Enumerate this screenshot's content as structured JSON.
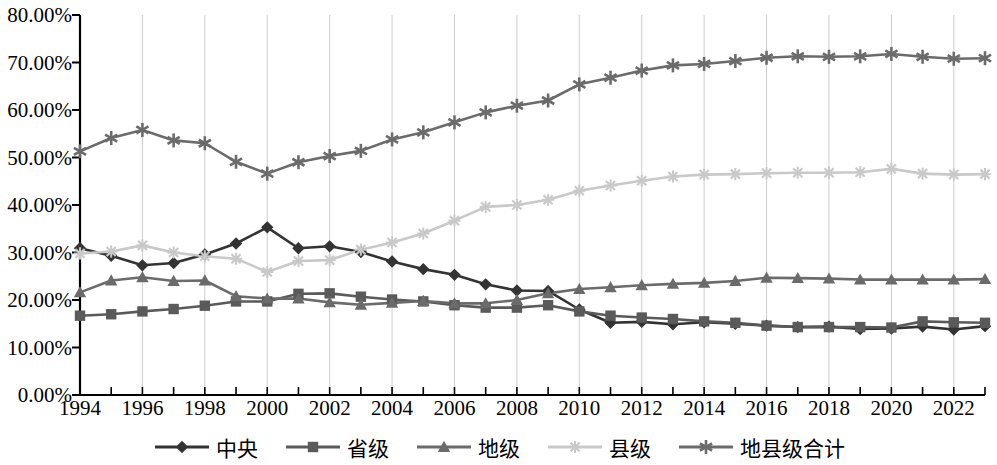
{
  "chart_data": {
    "type": "line",
    "title": "",
    "xlabel": "",
    "ylabel": "",
    "x": [
      1994,
      1995,
      1996,
      1997,
      1998,
      1999,
      2000,
      2001,
      2002,
      2003,
      2004,
      2005,
      2006,
      2007,
      2008,
      2009,
      2010,
      2011,
      2012,
      2013,
      2014,
      2015,
      2016,
      2017,
      2018,
      2019,
      2020,
      2021,
      2022,
      2023
    ],
    "tick_labels_x": [
      "1994",
      "1996",
      "1998",
      "2000",
      "2002",
      "2004",
      "2006",
      "2008",
      "2010",
      "2012",
      "2014",
      "2016",
      "2018",
      "2020",
      "2022"
    ],
    "tick_labels_y": [
      "0.00%",
      "10.00%",
      "20.00%",
      "30.00%",
      "40.00%",
      "50.00%",
      "60.00%",
      "70.00%",
      "80.00%"
    ],
    "ylim": [
      0,
      80
    ],
    "xlim": [
      1994,
      2023
    ],
    "grid": "vertical-every-2-years",
    "legend_position": "bottom",
    "series": [
      {
        "name": "中央",
        "marker": "diamond",
        "color": "#333333",
        "values": [
          30.9,
          29.3,
          27.3,
          27.8,
          29.6,
          31.9,
          35.3,
          30.9,
          31.3,
          30.1,
          28.1,
          26.5,
          25.3,
          23.3,
          22.0,
          21.9,
          18.0,
          15.2,
          15.4,
          14.9,
          15.3,
          15.0,
          14.6,
          14.3,
          14.4,
          13.9,
          14.0,
          14.4,
          13.8,
          14.5
        ]
      },
      {
        "name": "省级",
        "marker": "square",
        "color": "#5a5a5a",
        "values": [
          16.7,
          17.0,
          17.6,
          18.1,
          18.8,
          19.7,
          19.7,
          21.3,
          21.4,
          20.7,
          20.1,
          19.7,
          18.9,
          18.4,
          18.4,
          18.9,
          17.6,
          16.7,
          16.3,
          16.0,
          15.5,
          15.2,
          14.6,
          14.3,
          14.3,
          14.3,
          14.2,
          15.5,
          15.3,
          15.2
        ]
      },
      {
        "name": "地级",
        "marker": "triangle",
        "color": "#6b6b6b",
        "values": [
          21.6,
          24.1,
          24.8,
          24.0,
          24.1,
          20.8,
          20.3,
          20.3,
          19.5,
          19.0,
          19.4,
          19.8,
          19.3,
          19.3,
          20.0,
          21.4,
          22.3,
          22.7,
          23.1,
          23.4,
          23.6,
          24.0,
          24.7,
          24.6,
          24.5,
          24.3,
          24.3,
          24.3,
          24.3,
          24.4
        ]
      },
      {
        "name": "县级",
        "marker": "x-star",
        "color": "#c9c9c9",
        "values": [
          29.8,
          30.2,
          31.5,
          30.0,
          29.2,
          28.7,
          25.9,
          28.2,
          28.4,
          30.6,
          32.1,
          34.0,
          36.7,
          39.6,
          40.0,
          41.1,
          43.0,
          44.1,
          45.1,
          46.0,
          46.4,
          46.5,
          46.7,
          46.8,
          46.8,
          46.9,
          47.6,
          46.6,
          46.4,
          46.5
        ]
      },
      {
        "name": "地县级合计",
        "marker": "asterisk",
        "color": "#6b6b6b",
        "values": [
          51.3,
          54.1,
          55.8,
          53.6,
          53.0,
          49.1,
          46.6,
          49.0,
          50.3,
          51.4,
          53.8,
          55.3,
          57.4,
          59.5,
          60.9,
          62.0,
          65.4,
          66.8,
          68.3,
          69.4,
          69.7,
          70.3,
          71.0,
          71.3,
          71.2,
          71.3,
          71.8,
          71.2,
          70.8,
          70.9
        ]
      }
    ]
  },
  "legend": {
    "items": [
      {
        "label": "中央",
        "marker": "diamond",
        "color": "#333333"
      },
      {
        "label": "省级",
        "marker": "square",
        "color": "#5a5a5a"
      },
      {
        "label": "地级",
        "marker": "triangle",
        "color": "#6b6b6b"
      },
      {
        "label": "县级",
        "marker": "x-star",
        "color": "#c9c9c9"
      },
      {
        "label": "地县级合计",
        "marker": "asterisk",
        "color": "#6b6b6b"
      }
    ]
  },
  "axes": {
    "axis_color": "#000000",
    "grid_color": "#cccccc"
  }
}
